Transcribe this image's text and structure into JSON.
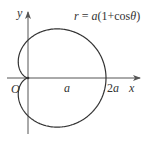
{
  "figure": {
    "equation": {
      "r": "r",
      "equals": " = ",
      "a": "a",
      "open": "(1+cos",
      "theta": "θ",
      "close": ")"
    },
    "axes": {
      "x_label": "x",
      "y_label": "y",
      "origin_label": "O"
    },
    "ticks": {
      "a_label": "a",
      "two_a_coef": "2",
      "two_a_var": "a"
    },
    "colors": {
      "stroke": "#333333",
      "axis": "#555555",
      "background": "#ffffff"
    }
  },
  "chart_data": {
    "type": "line",
    "title": "r = a(1+cosθ)",
    "curve": "cardioid",
    "polar_equation": "r = a(1 + cos θ)",
    "xlabel": "x",
    "ylabel": "y",
    "x_tick_labels": [
      "O",
      "a",
      "2a"
    ],
    "x_tick_values_in_a": [
      0,
      1,
      2
    ],
    "xlim_in_a": [
      -0.5,
      2.6
    ],
    "ylim_in_a": [
      -1.4,
      1.7
    ],
    "key_points_in_a": {
      "cusp": [
        0,
        0
      ],
      "rightmost": [
        2,
        0
      ],
      "top": [
        0.75,
        1.299
      ],
      "bottom": [
        0.75,
        -1.299
      ],
      "y_intercepts": [
        [
          0,
          1
        ],
        [
          0,
          -1
        ]
      ],
      "leftmost": [
        -0.25,
        0.433
      ]
    },
    "grid": false,
    "legend": false
  }
}
